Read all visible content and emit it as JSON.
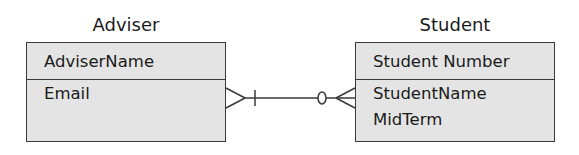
{
  "diagram": {
    "type": "ER diagram (crow's foot notation)",
    "entities": [
      {
        "name": "Adviser",
        "key_attributes": [
          "AdviserName"
        ],
        "attributes": [
          "Email"
        ]
      },
      {
        "name": "Student",
        "key_attributes": [
          "Student Number"
        ],
        "attributes": [
          "StudentName",
          "MidTerm"
        ]
      }
    ],
    "relationships": [
      {
        "from": "Adviser",
        "to": "Student",
        "adviser_end": "crow's foot with bar (one-or-many)",
        "student_end": "crow's foot with circle (zero-or-many)"
      }
    ]
  },
  "adviser": {
    "title": "Adviser",
    "key": "AdviserName",
    "attr_1": "Email"
  },
  "student": {
    "title": "Student",
    "key": "Student Number",
    "attr_1": "StudentName",
    "attr_2": "MidTerm"
  },
  "colors": {
    "box_fill": "#e4e4e4",
    "line": "#3a3a3a",
    "text": "#1a1a1a"
  }
}
